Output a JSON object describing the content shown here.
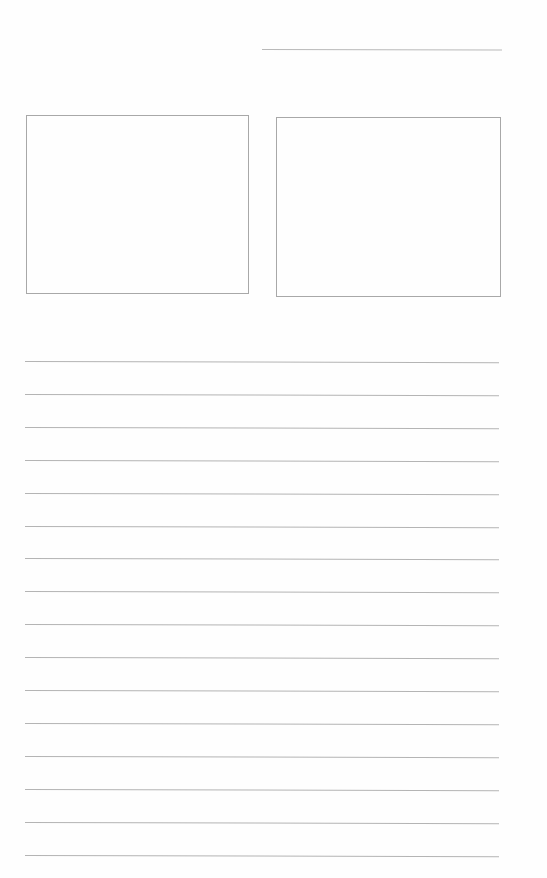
{
  "document": {
    "type": "blank worksheet",
    "header": {
      "name_line_label": ""
    },
    "picture_boxes": [
      {
        "id": "left",
        "content": ""
      },
      {
        "id": "right",
        "content": ""
      }
    ],
    "writing_lines": [
      {
        "text": ""
      },
      {
        "text": ""
      },
      {
        "text": ""
      },
      {
        "text": ""
      },
      {
        "text": ""
      },
      {
        "text": ""
      },
      {
        "text": ""
      },
      {
        "text": ""
      },
      {
        "text": ""
      },
      {
        "text": ""
      },
      {
        "text": ""
      },
      {
        "text": ""
      },
      {
        "text": ""
      },
      {
        "text": ""
      },
      {
        "text": ""
      },
      {
        "text": ""
      }
    ],
    "colors": {
      "paper": "#fefefe",
      "line": "#b4b4b4",
      "box_border": "#a8a8a8"
    }
  }
}
